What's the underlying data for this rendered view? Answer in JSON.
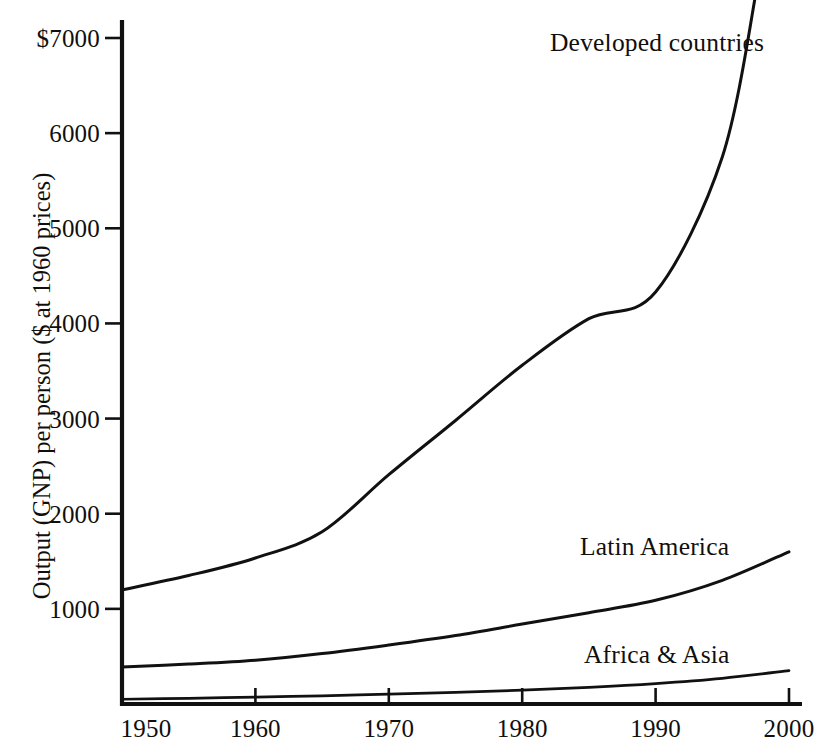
{
  "chart_data": {
    "type": "line",
    "title": "",
    "xlabel": "",
    "ylabel": "Output (GNP) per person ($ at 1960 prices)",
    "xlim": [
      1950,
      2000
    ],
    "ylim": [
      0,
      7000
    ],
    "grid": false,
    "legend_position": "inline-labels",
    "x_ticks": [
      "1950",
      "1960",
      "1970",
      "1980",
      "1990",
      "2000"
    ],
    "x_tick_values": [
      1950,
      1960,
      1970,
      1980,
      1990,
      2000
    ],
    "y_ticks": [
      "1000",
      "2000",
      "3000",
      "4000",
      "5000",
      "6000",
      "$7000"
    ],
    "y_tick_values": [
      1000,
      2000,
      3000,
      4000,
      5000,
      6000,
      7000
    ],
    "x": [
      1950,
      1955,
      1960,
      1965,
      1970,
      1975,
      1980,
      1985,
      1990,
      1995,
      2000
    ],
    "series": [
      {
        "name": "Developed countries",
        "label": "Developed countries",
        "values": [
          1200,
          1350,
          1535,
          1810,
          2410,
          2980,
          3560,
          4050,
          4330,
          5750,
          9200
        ],
        "clipped_at_top": true,
        "color": "#111111"
      },
      {
        "name": "Latin America",
        "label": "Latin America",
        "values": [
          390,
          420,
          460,
          530,
          620,
          720,
          840,
          960,
          1090,
          1300,
          1600
        ],
        "clipped_at_top": false,
        "color": "#111111"
      },
      {
        "name": "Africa & Asia",
        "label": "Africa & Asia",
        "values": [
          50,
          60,
          72,
          86,
          103,
          122,
          145,
          175,
          215,
          270,
          350
        ],
        "clipped_at_top": false,
        "color": "#111111"
      }
    ],
    "annotations": [
      {
        "text": "Developed countries",
        "x_px": 550,
        "y_px": 28
      },
      {
        "text": "Latin America",
        "x_px": 580,
        "y_px": 532
      },
      {
        "text": "Africa & Asia",
        "x_px": 584,
        "y_px": 640
      }
    ]
  },
  "axes": {
    "y_title": "Output (GNP) per person ($ at 1960 prices)",
    "y_labels": [
      {
        "text": "$7000",
        "value": 7000
      },
      {
        "text": "6000",
        "value": 6000
      },
      {
        "text": "5000",
        "value": 5000
      },
      {
        "text": "4000",
        "value": 4000
      },
      {
        "text": "3000",
        "value": 3000
      },
      {
        "text": "2000",
        "value": 2000
      },
      {
        "text": "1000",
        "value": 1000
      }
    ],
    "x_labels": [
      {
        "text": "1950",
        "value": 1950
      },
      {
        "text": "1960",
        "value": 1960
      },
      {
        "text": "1970",
        "value": 1970
      },
      {
        "text": "1980",
        "value": 1980
      },
      {
        "text": "1990",
        "value": 1990
      },
      {
        "text": "2000",
        "value": 2000
      }
    ]
  },
  "series_labels": {
    "developed": "Developed countries",
    "latin_america": "Latin America",
    "africa_asia": "Africa & Asia"
  }
}
